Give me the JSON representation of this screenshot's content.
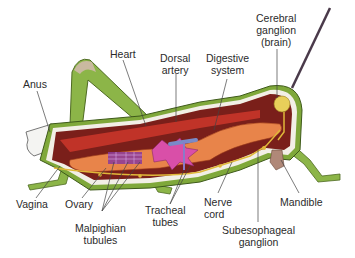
{
  "diagram": {
    "labels": [
      {
        "id": "anus",
        "text": "Anus"
      },
      {
        "id": "heart",
        "text": "Heart"
      },
      {
        "id": "dorsal_artery",
        "line1": "Dorsal",
        "line2": "artery"
      },
      {
        "id": "digestive_system",
        "line1": "Digestive",
        "line2": "system"
      },
      {
        "id": "cerebral_ganglion",
        "line1": "Cerebral",
        "line2": "ganglion",
        "line3": "(brain)"
      },
      {
        "id": "vagina",
        "text": "Vagina"
      },
      {
        "id": "ovary",
        "text": "Ovary"
      },
      {
        "id": "malpighian_tubules",
        "line1": "Malpighian",
        "line2": "tubules"
      },
      {
        "id": "tracheal_tubes",
        "line1": "Tracheal",
        "line2": "tubes"
      },
      {
        "id": "nerve_cord",
        "line1": "Nerve",
        "line2": "cord"
      },
      {
        "id": "subesophageal_ganglion",
        "line1": "Subesophageal",
        "line2": "ganglion"
      },
      {
        "id": "mandible",
        "text": "Mandible"
      }
    ],
    "colors": {
      "exoskeleton": "#7fa83a",
      "body_cavity": "#7a1f1a",
      "muscle": "#c8352a",
      "digestive": "#e8844a",
      "malpighian": "#8a3a9a",
      "gastric_caeca": "#d94fa8",
      "nerve": "#e0b83a",
      "brain": "#e8cf5a",
      "label_text": "#2b2b2b",
      "leader_line": "#444444"
    }
  }
}
